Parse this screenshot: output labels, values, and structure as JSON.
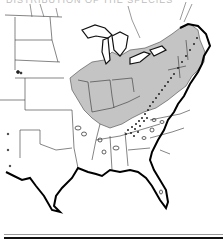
{
  "caption": {
    "text": "DISTRIBUTION OF THE SPECIES",
    "visibility": "partially cut off at top edge"
  },
  "map": {
    "region": "Eastern and Central United States",
    "style": "black-and-white scanned outline map",
    "colors": {
      "background": "#ffffff",
      "state_borders": "#333333",
      "coastline": "#000000",
      "shaded_range": "#c4c4c4",
      "stipple": "#222222"
    },
    "legend_areas": [
      {
        "name": "shaded-range",
        "description": "gray shaded states: Midwest, Ohio Valley, Great Lakes and Northeast"
      },
      {
        "name": "stippled-range",
        "description": "dense dot stippling along the Appalachian Mountains"
      },
      {
        "name": "isolated-records",
        "description": "small outlined spots/dots in the Plains, South and Southeast"
      }
    ]
  }
}
